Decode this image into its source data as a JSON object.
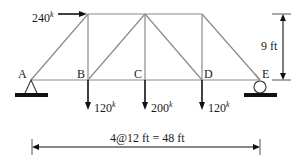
{
  "figure": {
    "type": "pratt-truss",
    "nodes": {
      "bottom": [
        "A",
        "B",
        "C",
        "D",
        "E"
      ]
    },
    "loads": {
      "horizontal": {
        "value": "240",
        "unit": "k",
        "at": "top-left node"
      },
      "vertical": [
        {
          "node": "B",
          "value": "120",
          "unit": "k"
        },
        {
          "node": "C",
          "value": "200",
          "unit": "k"
        },
        {
          "node": "D",
          "value": "120",
          "unit": "k"
        }
      ]
    },
    "supports": {
      "A": "pin",
      "E": "roller"
    },
    "dimensions": {
      "height": "9 ft",
      "span": "4@12 ft = 48 ft"
    },
    "colors": {
      "member": "#8a8a8a",
      "ink": "#111111"
    }
  }
}
